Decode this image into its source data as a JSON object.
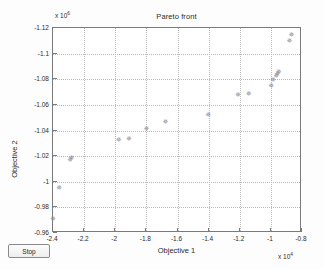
{
  "window": {
    "stop_button_label": "Stop"
  },
  "chart_data": {
    "type": "scatter",
    "title": "Pareto front",
    "xlabel": "Objective 1",
    "ylabel": "Objective 2",
    "x_exponent_label": "x 10",
    "x_exponent": "4",
    "y_exponent_label": "x 10",
    "y_exponent": "6",
    "x_scale": 10000,
    "y_scale": 1000000,
    "xlim": [
      -2.4,
      -0.8
    ],
    "ylim": [
      -1.12,
      -0.96
    ],
    "xticks": [
      "-2.4",
      "-2.2",
      "-2",
      "-1.8",
      "-1.6",
      "-1.4",
      "-1.2",
      "-1",
      "-0.8"
    ],
    "yticks": [
      "-0.96",
      "-0.98",
      "-1",
      "-1.02",
      "-1.04",
      "-1.06",
      "-1.08",
      "-1.1",
      "-1.12"
    ],
    "xtick_values": [
      -2.4,
      -2.2,
      -2.0,
      -1.8,
      -1.6,
      -1.4,
      -1.2,
      -1.0,
      -0.8
    ],
    "ytick_values": [
      -0.96,
      -0.98,
      -1.0,
      -1.02,
      -1.04,
      -1.06,
      -1.08,
      -1.1,
      -1.12
    ],
    "grid": true,
    "legend": null,
    "marker": "star",
    "marker_color": "#8e8e96",
    "series": [
      {
        "name": "Pareto front",
        "points": [
          {
            "x": -2.4,
            "y": -0.9705
          },
          {
            "x": -2.36,
            "y": -0.9945
          },
          {
            "x": -2.29,
            "y": -1.0165
          },
          {
            "x": -2.282,
            "y": -1.0185
          },
          {
            "x": -1.978,
            "y": -1.0322
          },
          {
            "x": -1.912,
            "y": -1.0333
          },
          {
            "x": -1.8,
            "y": -1.0405
          },
          {
            "x": -1.678,
            "y": -1.0462
          },
          {
            "x": -1.402,
            "y": -1.0518
          },
          {
            "x": -1.212,
            "y": -1.0672
          },
          {
            "x": -1.142,
            "y": -1.0678
          },
          {
            "x": -0.998,
            "y": -1.074
          },
          {
            "x": -0.986,
            "y": -1.079
          },
          {
            "x": -0.966,
            "y": -1.0818
          },
          {
            "x": -0.958,
            "y": -1.0838
          },
          {
            "x": -0.95,
            "y": -1.085
          },
          {
            "x": -0.88,
            "y": -1.1095
          },
          {
            "x": -0.868,
            "y": -1.114
          }
        ]
      }
    ]
  }
}
